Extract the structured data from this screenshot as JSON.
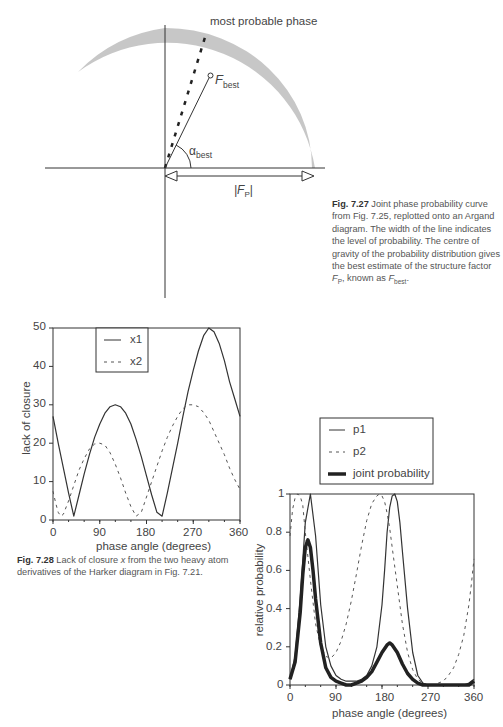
{
  "fig727": {
    "label_most_probable": "most probable phase",
    "label_fbest_main": "F",
    "label_fbest_sub": "best",
    "label_alpha_main": "α",
    "label_alpha_sub": "best",
    "label_fp_main": "|F",
    "label_fp_sub": "P",
    "label_fp_end": "|",
    "caption_bold": "Fig. 7.27",
    "caption_text": "Joint phase probability curve from Fig. 7.25, replotted onto an Argand diagram. The width of the line indicates the level of probability. The centre of gravity of the probability distribution gives the best estimate of the structure factor ",
    "caption_fp": "F",
    "caption_fp_sub": "P",
    "caption_mid": ", known as ",
    "caption_fbest": "F",
    "caption_fbest_sub": "best",
    "caption_end": "."
  },
  "fig728": {
    "caption_bold": "Fig. 7.28",
    "caption_text_1": "Lack of closure ",
    "caption_x": "x",
    "caption_text_2": " from the two heavy atom derivatives of the Harker diagram in Fig. 7.21."
  },
  "chart_data": [
    {
      "type": "line",
      "title": "",
      "xlabel": "phase angle (degrees)",
      "ylabel": "lack of closure",
      "xlim": [
        0,
        360
      ],
      "ylim": [
        0,
        50
      ],
      "xticks": [
        "0",
        "90",
        "180",
        "270",
        "360"
      ],
      "yticks": [
        "0",
        "10",
        "20",
        "30",
        "40",
        "50"
      ],
      "grid": false,
      "legend_position": "upper-left-inside",
      "series": [
        {
          "name": "x1",
          "style": "solid",
          "x": [
            0,
            10,
            20,
            30,
            40,
            50,
            60,
            70,
            80,
            90,
            100,
            110,
            120,
            130,
            140,
            150,
            160,
            170,
            180,
            190,
            200,
            210,
            220,
            230,
            240,
            250,
            260,
            270,
            280,
            290,
            300,
            310,
            320,
            330,
            340,
            350,
            360
          ],
          "y": [
            27,
            20,
            13.5,
            7,
            1,
            6.5,
            12,
            17,
            21.5,
            25,
            27.8,
            29.5,
            30,
            29.5,
            27.8,
            25,
            21,
            16.5,
            11.5,
            6.5,
            2,
            1,
            7,
            13.5,
            20,
            27,
            33.5,
            39,
            44,
            48,
            50,
            49,
            46,
            41.5,
            36,
            31.5,
            27
          ]
        },
        {
          "name": "x2",
          "style": "dashed",
          "x": [
            0,
            5,
            10,
            15,
            20,
            30,
            40,
            50,
            60,
            70,
            80,
            90,
            100,
            110,
            120,
            130,
            140,
            150,
            160,
            170,
            180,
            190,
            200,
            210,
            220,
            230,
            240,
            250,
            260,
            270,
            280,
            290,
            300,
            310,
            320,
            330,
            340,
            350,
            360
          ],
          "y": [
            7.5,
            4.5,
            2,
            1,
            1.5,
            5,
            9,
            13,
            16,
            18.5,
            19.8,
            20,
            19.5,
            17.5,
            14.5,
            11,
            7,
            3.5,
            1,
            2,
            6,
            10,
            14,
            18,
            21.5,
            24.5,
            27,
            29,
            30,
            30,
            29.5,
            28,
            26,
            23,
            20,
            17,
            13.5,
            10.5,
            8
          ]
        }
      ]
    },
    {
      "type": "line",
      "title": "",
      "xlabel": "phase angle (degrees)",
      "ylabel": "relative probability",
      "xlim": [
        0,
        360
      ],
      "ylim": [
        0,
        1
      ],
      "xticks": [
        "0",
        "90",
        "180",
        "270",
        "360"
      ],
      "yticks": [
        "0",
        "0.2",
        "0.4",
        "0.6",
        "0.8",
        "1"
      ],
      "grid": false,
      "legend_position": "above-plot",
      "series": [
        {
          "name": "p1",
          "style": "solid",
          "x": [
            0,
            10,
            20,
            30,
            40,
            50,
            60,
            70,
            80,
            90,
            100,
            110,
            120,
            130,
            140,
            150,
            160,
            170,
            180,
            185,
            190,
            195,
            200,
            205,
            210,
            215,
            220,
            230,
            240,
            250,
            260,
            270,
            280,
            290,
            300,
            310,
            320,
            330,
            340,
            350,
            360
          ],
          "y": [
            0.03,
            0.15,
            0.45,
            0.85,
            1.0,
            0.78,
            0.42,
            0.2,
            0.1,
            0.05,
            0.03,
            0.02,
            0.02,
            0.02,
            0.03,
            0.05,
            0.1,
            0.2,
            0.42,
            0.6,
            0.8,
            0.93,
            0.99,
            1.0,
            0.96,
            0.85,
            0.7,
            0.4,
            0.17,
            0.05,
            0.01,
            0.0,
            0.0,
            0.0,
            0.0,
            0.0,
            0.0,
            0.0,
            0.0,
            0.01,
            0.03
          ]
        },
        {
          "name": "p2",
          "style": "dashed",
          "x": [
            0,
            5,
            10,
            15,
            20,
            25,
            30,
            40,
            50,
            60,
            70,
            80,
            90,
            100,
            110,
            120,
            130,
            140,
            150,
            160,
            170,
            175,
            180,
            185,
            190,
            195,
            200,
            210,
            220,
            230,
            240,
            250,
            260,
            270,
            280,
            290,
            300,
            310,
            320,
            330,
            340,
            350,
            355,
            360
          ],
          "y": [
            0.78,
            0.92,
            0.98,
            1.0,
            0.99,
            0.94,
            0.8,
            0.55,
            0.32,
            0.2,
            0.15,
            0.14,
            0.17,
            0.23,
            0.32,
            0.44,
            0.58,
            0.73,
            0.86,
            0.95,
            0.99,
            1.0,
            0.99,
            0.96,
            0.9,
            0.82,
            0.72,
            0.52,
            0.32,
            0.17,
            0.08,
            0.03,
            0.01,
            0.0,
            0.0,
            0.01,
            0.02,
            0.05,
            0.09,
            0.16,
            0.26,
            0.42,
            0.53,
            0.66
          ]
        },
        {
          "name": "joint probability",
          "style": "thick",
          "x": [
            0,
            10,
            20,
            25,
            30,
            35,
            40,
            45,
            50,
            60,
            70,
            80,
            90,
            100,
            110,
            120,
            130,
            140,
            150,
            160,
            170,
            180,
            190,
            195,
            200,
            210,
            220,
            230,
            240,
            250,
            260,
            270,
            280,
            290,
            300,
            310,
            320,
            330,
            340,
            350,
            355,
            360
          ],
          "y": [
            0.03,
            0.12,
            0.38,
            0.58,
            0.72,
            0.76,
            0.72,
            0.6,
            0.45,
            0.22,
            0.09,
            0.04,
            0.02,
            0.01,
            0.0,
            0.0,
            0.01,
            0.02,
            0.04,
            0.07,
            0.12,
            0.17,
            0.21,
            0.22,
            0.21,
            0.17,
            0.11,
            0.06,
            0.03,
            0.01,
            0.0,
            0.0,
            0.0,
            0.0,
            0.0,
            0.0,
            0.0,
            0.0,
            0.0,
            0.0,
            0.01,
            0.02
          ]
        }
      ]
    }
  ]
}
